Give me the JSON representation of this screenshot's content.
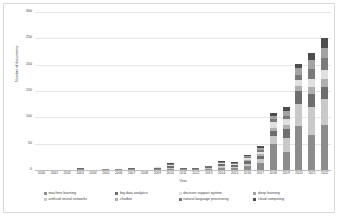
{
  "chart_data": {
    "type": "bar",
    "subtype": "stacked-column",
    "title": "",
    "xlabel": "Year",
    "ylabel": "Number of documents",
    "ylim": [
      0,
      300
    ],
    "yticks": [
      0,
      50,
      100,
      150,
      200,
      250,
      300
    ],
    "ytick_labels": [
      "0",
      "50",
      "100",
      "150",
      "200",
      "250",
      "300"
    ],
    "grid": true,
    "legend_position": "bottom",
    "categories": [
      "2000",
      "2001",
      "2002",
      "2003",
      "2004",
      "2005",
      "2006",
      "2007",
      "2008",
      "2009",
      "2010",
      "2011",
      "2012",
      "2013",
      "2014",
      "2015",
      "2016",
      "2017",
      "2018",
      "2019",
      "2020",
      "2021",
      "2022"
    ],
    "series": [
      {
        "name": "machine learning",
        "color": "#8c8c8c",
        "values": [
          0,
          0,
          0,
          1,
          0,
          1,
          1,
          1,
          0,
          1,
          2,
          1,
          1,
          2,
          4,
          3,
          7,
          14,
          50,
          35,
          84,
          67,
          85
        ]
      },
      {
        "name": "artificial neural networks",
        "color": "#c9c9c9",
        "values": [
          0,
          0,
          0,
          1,
          0,
          0,
          0,
          1,
          0,
          1,
          2,
          1,
          1,
          1,
          3,
          3,
          5,
          6,
          14,
          25,
          42,
          52,
          50
        ]
      },
      {
        "name": "big data analytics",
        "color": "#6e6e6e",
        "values": [
          0,
          0,
          0,
          1,
          0,
          0,
          0,
          1,
          0,
          2,
          3,
          1,
          1,
          2,
          4,
          3,
          6,
          7,
          10,
          18,
          24,
          25,
          22
        ]
      },
      {
        "name": "chatbot",
        "color": "#b0b0b0",
        "values": [
          0,
          0,
          0,
          0,
          0,
          0,
          0,
          0,
          0,
          0,
          1,
          0,
          0,
          0,
          1,
          1,
          2,
          3,
          5,
          8,
          9,
          14,
          15
        ]
      },
      {
        "name": "decision support system",
        "color": "#e0e0e0",
        "values": [
          0,
          0,
          0,
          1,
          0,
          0,
          0,
          0,
          0,
          1,
          2,
          1,
          1,
          1,
          2,
          2,
          3,
          5,
          12,
          10,
          12,
          15,
          18
        ]
      },
      {
        "name": "natural language processing",
        "color": "#7a7a7a",
        "values": [
          0,
          0,
          0,
          0,
          0,
          0,
          0,
          0,
          0,
          0,
          1,
          0,
          0,
          1,
          1,
          1,
          2,
          3,
          5,
          7,
          10,
          18,
          22
        ]
      },
      {
        "name": "deep learning",
        "color": "#a3a3a3",
        "values": [
          0,
          0,
          0,
          0,
          0,
          0,
          0,
          0,
          0,
          0,
          1,
          0,
          0,
          1,
          1,
          1,
          2,
          4,
          6,
          9,
          12,
          18,
          20
        ]
      },
      {
        "name": "cloud computing",
        "color": "#4d4d4d",
        "values": [
          0,
          0,
          0,
          0,
          0,
          0,
          0,
          0,
          0,
          0,
          1,
          0,
          0,
          0,
          1,
          1,
          2,
          3,
          6,
          7,
          8,
          13,
          18
        ]
      }
    ],
    "totals": [
      0,
      0,
      0,
      4,
      0,
      1,
      1,
      3,
      0,
      5,
      13,
      4,
      4,
      8,
      17,
      15,
      29,
      45,
      108,
      119,
      201,
      222,
      250
    ]
  },
  "axis": {
    "y_title": "Number of documents",
    "x_title": "Year"
  },
  "legend": {
    "row1": [
      {
        "label": "machine learning",
        "color": "#8c8c8c"
      },
      {
        "label": "big data analytics",
        "color": "#6e6e6e"
      },
      {
        "label": "decision support system",
        "color": "#e0e0e0"
      },
      {
        "label": "deep learning",
        "color": "#a3a3a3"
      }
    ],
    "row2": [
      {
        "label": "artificial neural networks",
        "color": "#c9c9c9"
      },
      {
        "label": "chatbot",
        "color": "#b0b0b0"
      },
      {
        "label": "natural language processing",
        "color": "#7a7a7a"
      },
      {
        "label": "cloud computing",
        "color": "#4d4d4d"
      }
    ]
  }
}
